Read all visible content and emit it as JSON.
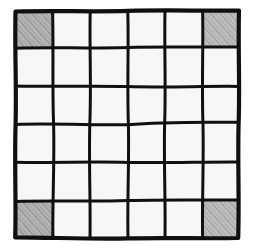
{
  "figure": {
    "kind": "hand-drawn-grid-diagram",
    "background_color": "#ffffff"
  },
  "grid": {
    "rows": 6,
    "columns": 6,
    "total_cells": 36,
    "bounds": {
      "left": 14,
      "top": 10,
      "right": 240,
      "bottom": 239
    },
    "line_color": "#101010",
    "border_stroke_width": 4.2,
    "interior_stroke_width": 3.0,
    "cell_fill_color": "#f7f7f5",
    "shaded_fill_color": "#b3b3b3",
    "hatch_color": "#8d8d8d",
    "hand_drawn": true,
    "shaded_cells": [
      {
        "row": 1,
        "col": 1,
        "position": "top-left"
      },
      {
        "row": 1,
        "col": 6,
        "position": "top-right"
      },
      {
        "row": 6,
        "col": 1,
        "position": "bottom-left"
      },
      {
        "row": 6,
        "col": 6,
        "position": "bottom-right"
      }
    ],
    "shading_style": "diagonal pencil hatching, lower-left to upper-right",
    "x_lines": [
      14,
      52,
      90,
      128,
      165,
      202,
      240
    ],
    "y_lines": [
      10,
      48,
      86,
      124,
      162,
      201,
      239
    ],
    "cells": [
      [
        1,
        0,
        0,
        0,
        0,
        1
      ],
      [
        0,
        0,
        0,
        0,
        0,
        0
      ],
      [
        0,
        0,
        0,
        0,
        0,
        0
      ],
      [
        0,
        0,
        0,
        0,
        0,
        0
      ],
      [
        0,
        0,
        0,
        0,
        0,
        0
      ],
      [
        1,
        0,
        0,
        0,
        0,
        1
      ]
    ]
  }
}
